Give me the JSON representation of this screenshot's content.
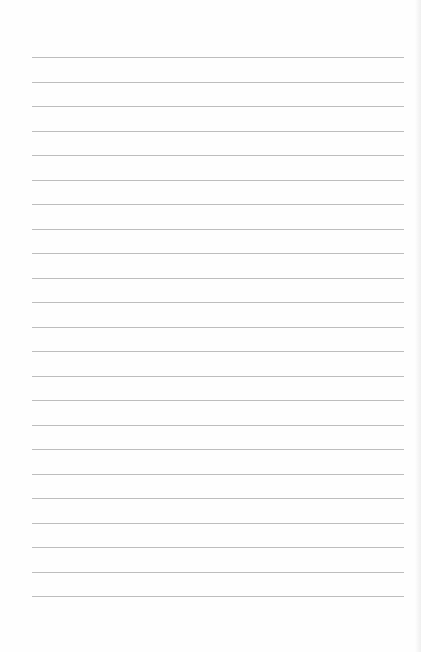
{
  "page": {
    "type": "lined-paper",
    "line_color": "#bdbdbd",
    "background": "#fefefe",
    "line_count": 23,
    "first_line_y": 57,
    "line_spacing": 24.5,
    "line_left": 32,
    "line_width": 372,
    "lines": []
  }
}
